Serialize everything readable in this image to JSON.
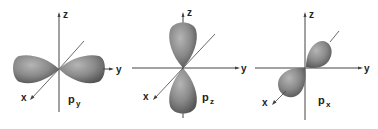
{
  "figure": {
    "panels": [
      {
        "id": "py",
        "label_main": "p",
        "label_sub": "y",
        "axes": {
          "z": "z",
          "y": "y",
          "x": "x"
        },
        "lobe_axis": "y"
      },
      {
        "id": "pz",
        "label_main": "p",
        "label_sub": "z",
        "axes": {
          "z": "z",
          "y": "y",
          "x": "x"
        },
        "lobe_axis": "z"
      },
      {
        "id": "px",
        "label_main": "p",
        "label_sub": "x",
        "axes": {
          "z": "z",
          "y": "y",
          "x": "x"
        },
        "lobe_axis": "x"
      }
    ],
    "colors": {
      "lobe_light": "#a6a6a6",
      "lobe_dark": "#5a5a5a",
      "axis": "#444444",
      "background": "#ffffff"
    }
  }
}
